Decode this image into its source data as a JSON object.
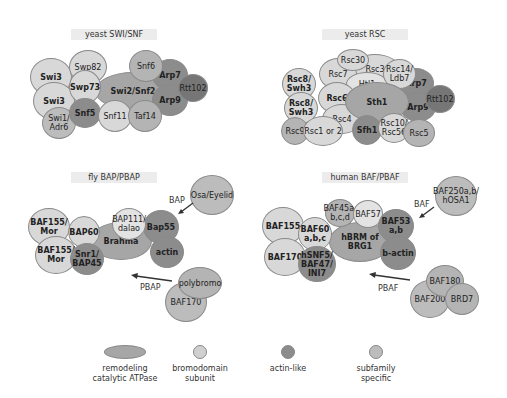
{
  "panels": {
    "swisnf": {
      "title": "yeast SWI/SNF",
      "subunits": [
        "Swi3",
        "Swi3",
        "Swp82",
        "Swp73",
        "Swi2/Snf2",
        "Snf6",
        "Arp7",
        "Rtt102",
        "Arp9",
        "Snf5",
        "Snf11",
        "Taf14",
        "Swi1/\nAdr6"
      ]
    },
    "rsc": {
      "title": "yeast RSC",
      "subunits": [
        "Rsc30",
        "Rsc7",
        "Rsc3",
        "Htl1",
        "Rsc14/\nLdb7",
        "Rsc8/\nSwh3",
        "Rsc8/\nSwh3",
        "Rsc6",
        "Sth1",
        "Arp7",
        "Rtt102",
        "Arp9",
        "Rsc4",
        "Rsc9",
        "Rsc1 or 2",
        "Sfh1",
        "Rsc10/\nRsc56",
        "Rsc5"
      ]
    },
    "fly": {
      "title": "fly BAP/PBAP",
      "subunits": [
        "BAF155/\nMor",
        "BAP60",
        "BAF155/\nMor",
        "Snr1/\nBAP45",
        "Brahma",
        "BAP111/\ndalao",
        "Bap55",
        "actin",
        "Osa/Eyelid",
        "polybromo",
        "BAF170"
      ],
      "arrow_labels": [
        "BAP",
        "PBAP"
      ]
    },
    "human": {
      "title": "human BAF/PBAF",
      "subunits": [
        "BAF155",
        "BAF170",
        "BAF60\na,b,c",
        "hSNF5/\nBAF47/\nINI7",
        "hBRM of\nBRG1",
        "BAF45a,\nb,c,d",
        "BAF57",
        "BAF53\na,b",
        "b-actin",
        "BAF250a,b/\nhOSA1",
        "BAF180",
        "BAF200",
        "BRD7"
      ],
      "arrow_labels": [
        "BAF",
        "PBAF"
      ]
    }
  },
  "legend": [
    {
      "label": "remodeling\ncatalytic ATPase",
      "color": "#a6a6a6"
    },
    {
      "label": "bromodomain\nsubunit",
      "color": "#d0d0d0"
    },
    {
      "label": "actin-like",
      "color": "#8c8c8c"
    },
    {
      "label": "subfamily\nspecific",
      "color": "#bcbcbc"
    }
  ]
}
